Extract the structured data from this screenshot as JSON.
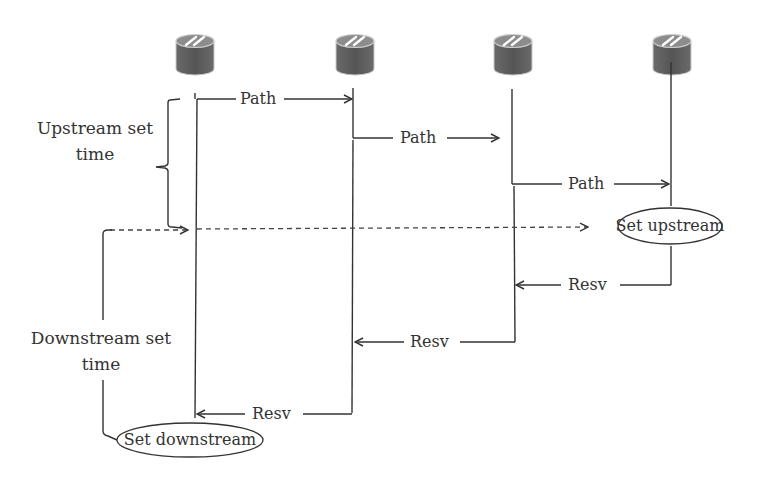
{
  "diagram": {
    "type": "sequence",
    "routers": [
      {
        "id": "r1",
        "x": 195
      },
      {
        "id": "r2",
        "x": 352
      },
      {
        "id": "r3",
        "x": 513
      },
      {
        "id": "r4",
        "x": 670
      }
    ],
    "messages": {
      "path1": "Path",
      "path2": "Path",
      "path3": "Path",
      "resv1": "Resv",
      "resv2": "Resv",
      "resv3": "Resv"
    },
    "annotations": {
      "upstream_line1": "Upstream set",
      "upstream_line2": "time",
      "downstream_line1": "Downstream set",
      "downstream_line2": "time"
    },
    "ellipses": {
      "set_upstream": "Set upstream",
      "set_downstream": "Set downstream"
    },
    "colors": {
      "line": "#333333",
      "router_body": "#5a5a5a",
      "router_top": "#8a8a8a"
    }
  }
}
